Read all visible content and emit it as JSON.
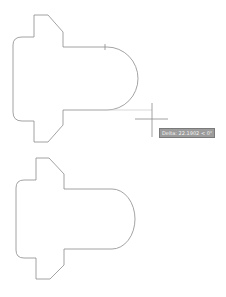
{
  "drawing": {
    "background": "#ffffff",
    "line_color": "#8c8c8c",
    "preview_color": "#c8c8c8",
    "crosshair_color": "#8a8a8a",
    "shapes": [
      {
        "name": "upper-profile"
      },
      {
        "name": "lower-profile"
      }
    ]
  },
  "cursor": {
    "icon": "crosshair-icon",
    "x": 152,
    "y": 119
  },
  "tooltip": {
    "text": "Delta: 22.1902 < 0°"
  }
}
